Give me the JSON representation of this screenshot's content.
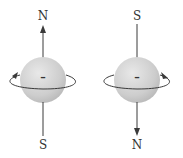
{
  "figure": {
    "electrons": [
      {
        "id": "left",
        "charge_symbol": "–",
        "top_pole": "N",
        "bottom_pole": "S",
        "axis_arrow": "up",
        "rotation_arrow_side": "left"
      },
      {
        "id": "right",
        "charge_symbol": "–",
        "top_pole": "S",
        "bottom_pole": "N",
        "axis_arrow": "down",
        "rotation_arrow_side": "right"
      }
    ],
    "colors": {
      "sphere": "#c8c8c8",
      "sphere_highlight": "#e6e6e6",
      "lines": "#3a3a3a",
      "text": "#333333"
    }
  }
}
